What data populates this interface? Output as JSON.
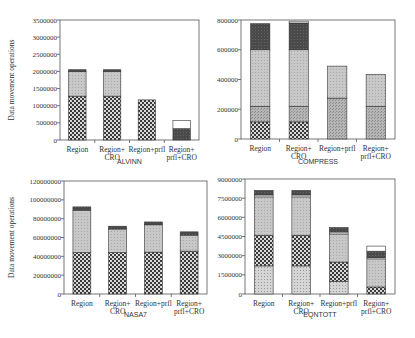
{
  "chart_data": [
    {
      "type": "bar",
      "stacked": true,
      "title": "ALVINN",
      "xlabel": "ALVINN",
      "ylabel": "Data movement operations",
      "ylim": [
        0,
        3500000
      ],
      "yticks": [
        0,
        500000,
        1000000,
        1500000,
        2000000,
        2500000,
        3000000,
        3500000
      ],
      "ytick_labels": [
        "0",
        "500000",
        "1000000",
        "1500000",
        "2000000",
        "2500000",
        "3000000",
        "3500000"
      ],
      "categories": [
        "Region",
        "Region+\nCRO",
        "Region+prfl",
        "Region+\nprfl+CRO"
      ],
      "series": [
        {
          "name": "segment-checker",
          "pattern": "checker",
          "values": [
            1280000,
            1280000,
            1170000,
            0
          ]
        },
        {
          "name": "segment-light",
          "pattern": "light",
          "values": [
            720000,
            720000,
            0,
            0
          ]
        },
        {
          "name": "segment-dark",
          "pattern": "dark",
          "values": [
            50000,
            50000,
            0,
            330000
          ]
        },
        {
          "name": "segment-white",
          "pattern": "white",
          "values": [
            0,
            0,
            0,
            240000
          ]
        }
      ]
    },
    {
      "type": "bar",
      "stacked": true,
      "title": "COMPRESS",
      "xlabel": "COMPRESS",
      "ylabel": "",
      "ylim": [
        0,
        800000
      ],
      "yticks": [
        0,
        200000,
        400000,
        600000,
        800000
      ],
      "ytick_labels": [
        "0",
        "200000",
        "400000",
        "600000",
        "800000"
      ],
      "categories": [
        "Region",
        "Region+\nCRO",
        "Region+prfl",
        "Region+\nprfl+CRO"
      ],
      "series": [
        {
          "name": "segment-checker",
          "pattern": "checker",
          "values": [
            115000,
            115000,
            0,
            0
          ]
        },
        {
          "name": "segment-medium",
          "pattern": "medium",
          "values": [
            105000,
            105000,
            275000,
            220000
          ]
        },
        {
          "name": "segment-light",
          "pattern": "light",
          "values": [
            380000,
            380000,
            215000,
            215000
          ]
        },
        {
          "name": "segment-dark",
          "pattern": "dark",
          "values": [
            175000,
            180000,
            0,
            0
          ]
        },
        {
          "name": "segment-white",
          "pattern": "white",
          "values": [
            0,
            12000,
            0,
            0
          ]
        }
      ]
    },
    {
      "type": "bar",
      "stacked": true,
      "title": "NASA7",
      "xlabel": "NASA7",
      "ylabel": "Data movement operations",
      "ylim": [
        0,
        120000000
      ],
      "yticks": [
        0,
        20000000,
        40000000,
        60000000,
        80000000,
        100000000,
        120000000
      ],
      "ytick_labels": [
        "0",
        "20000000",
        "40000000",
        "60000000",
        "80000000",
        "100000000",
        "120000000"
      ],
      "categories": [
        "Region",
        "Region+\nCRO",
        "Region+prfl",
        "Region+\nprfl+CRO"
      ],
      "series": [
        {
          "name": "segment-checker",
          "pattern": "checker",
          "values": [
            44000000,
            44000000,
            44500000,
            45500000
          ]
        },
        {
          "name": "segment-light",
          "pattern": "light",
          "values": [
            45000000,
            25000000,
            29000000,
            17000000
          ]
        },
        {
          "name": "segment-dark",
          "pattern": "dark",
          "values": [
            3500000,
            3000000,
            3000000,
            3500000
          ]
        }
      ]
    },
    {
      "type": "bar",
      "stacked": true,
      "title": "EQNTOTT",
      "xlabel": "EQNTOTT",
      "ylabel": "",
      "ylim": [
        0,
        9000000
      ],
      "yticks": [
        0,
        1500000,
        3000000,
        4500000,
        6000000,
        7500000,
        9000000
      ],
      "ytick_labels": [
        "0",
        "1500000",
        "3000000",
        "4500000",
        "6000000",
        "7500000",
        "9000000"
      ],
      "categories": [
        "Region",
        "Region+\nCRO",
        "Region+prfl",
        "Region+\nprfl+CRO"
      ],
      "series": [
        {
          "name": "segment-lightdot",
          "pattern": "lightdot",
          "values": [
            2200000,
            2200000,
            1000000,
            0
          ]
        },
        {
          "name": "segment-checker",
          "pattern": "checker",
          "values": [
            2400000,
            2400000,
            1500000,
            550000
          ]
        },
        {
          "name": "segment-light",
          "pattern": "light",
          "values": [
            3000000,
            3000000,
            2200000,
            2200000
          ]
        },
        {
          "name": "segment-thinwhite",
          "pattern": "white",
          "values": [
            150000,
            150000,
            150000,
            100000
          ]
        },
        {
          "name": "segment-dark",
          "pattern": "dark",
          "values": [
            350000,
            350000,
            350000,
            500000
          ]
        },
        {
          "name": "segment-white",
          "pattern": "white",
          "values": [
            0,
            0,
            0,
            400000
          ]
        }
      ]
    }
  ]
}
